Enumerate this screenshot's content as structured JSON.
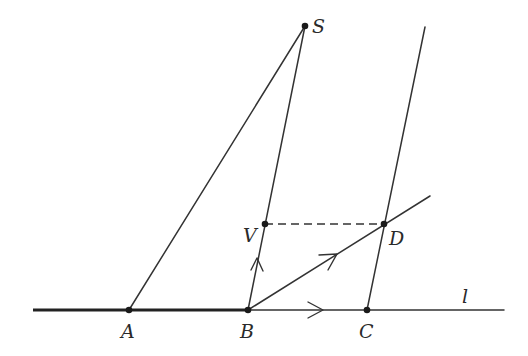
{
  "diagram": {
    "line_label": "l",
    "points": {
      "S": {
        "label": "S",
        "x": 305,
        "y": 26
      },
      "V": {
        "label": "V",
        "x": 265,
        "y": 224
      },
      "D": {
        "label": "D",
        "x": 384,
        "y": 224
      },
      "A": {
        "label": "A",
        "x": 129,
        "y": 310
      },
      "B": {
        "label": "B",
        "x": 248,
        "y": 310
      },
      "C": {
        "label": "C",
        "x": 367,
        "y": 310
      }
    },
    "segments": [
      {
        "name": "line-l",
        "from": [
          33,
          310
        ],
        "to": [
          504,
          310
        ],
        "note": "thick from left end to B"
      },
      {
        "name": "segment-SA",
        "from": "S",
        "to": "A"
      },
      {
        "name": "segment-SB",
        "from": "S",
        "to": "B"
      },
      {
        "name": "line-through-C",
        "from": "C",
        "to": [
          425,
          27
        ]
      },
      {
        "name": "ray-BD",
        "from": "B",
        "to": [
          430,
          196
        ]
      },
      {
        "name": "dashed-VD",
        "from": "V",
        "to": "D",
        "style": "dashed"
      }
    ],
    "arrows": [
      {
        "name": "arrow-on-BV",
        "direction": "up"
      },
      {
        "name": "arrow-on-BD",
        "direction": "up-right"
      },
      {
        "name": "arrow-on-l",
        "direction": "right"
      }
    ]
  }
}
